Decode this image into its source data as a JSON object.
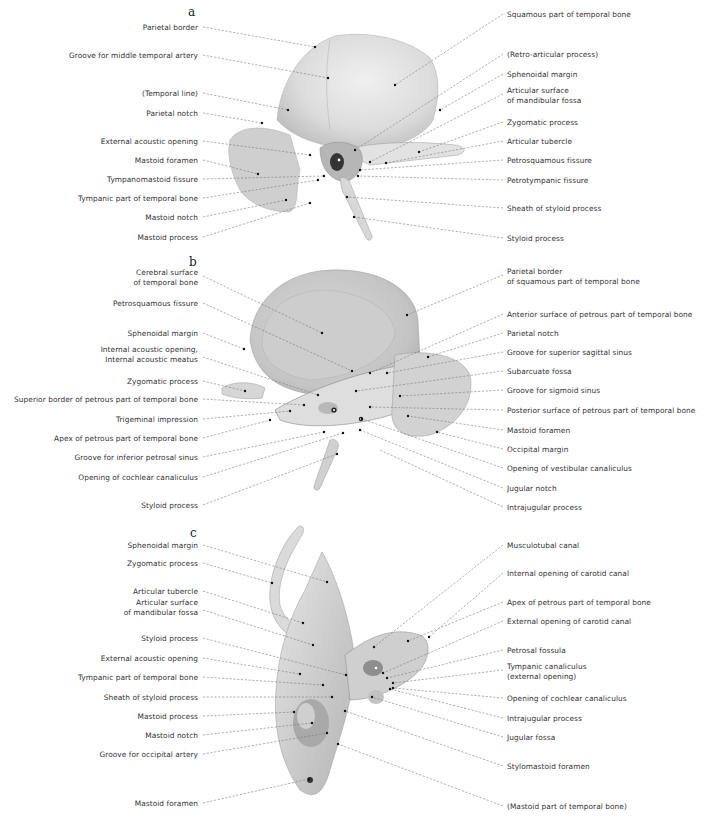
{
  "figure": {
    "subject": "Temporal bone",
    "panels": [
      {
        "id": "a",
        "letter": "a",
        "left_labels": [
          "Parietal border",
          "Groove for middle temporal artery",
          "(Temporal line)",
          "Parietal notch",
          "External acoustic opening",
          "Mastoid foramen",
          "Tympanomastoid fissure",
          "Tympanic part of temporal bone",
          "Mastoid notch",
          "Mastoid process"
        ],
        "right_labels": [
          "Squamous part of temporal bone",
          "(Retro-articular process)",
          "Sphenoidal margin",
          "Articular surface\nof mandibular fossa",
          "Zygomatic process",
          "Articular tubercle",
          "Petrosquamous fissure",
          "Petrotympanic fissure",
          "Sheath of styloid process",
          "Styloid process"
        ]
      },
      {
        "id": "b",
        "letter": "b",
        "left_labels": [
          "Cerebral surface\nof temporal bone",
          "Petrosquamous fissure",
          "Sphenoidal margin",
          "Internal acoustic opening,\nInternal acoustic meatus",
          "Zygomatic process",
          "Superior border of petrous part of temporal bone",
          "Trigeminal impression",
          "Apex of petrous part of temporal bone",
          "Groove for inferior petrosal sinus",
          "Opening of cochlear canaliculus",
          "Styloid process"
        ],
        "right_labels": [
          "Parietal border\nof squamous part of temporal bone",
          "Anterior surface of petrous part of temporal bone",
          "Parietal notch",
          "Groove for superior sagittal sinus",
          "Subarcuate fossa",
          "Groove for sigmoid sinus",
          "Posterior surface of petrous part of temporal bone",
          "Mastoid foramen",
          "Occipital margin",
          "Opening of vestibular canaliculus",
          "Jugular notch",
          "Intrajugular process"
        ]
      },
      {
        "id": "c",
        "letter": "c",
        "left_labels": [
          "Sphenoidal margin",
          "Zygomatic process",
          "Articular tubercle",
          "Articular surface\nof mandibular fossa",
          "Styloid process",
          "External acoustic opening",
          "Tympanic part of temporal bone",
          "Sheath of styloid process",
          "Mastoid process",
          "Mastoid notch",
          "Groove for occipital artery",
          "Mastoid foramen"
        ],
        "right_labels": [
          "Musculotubal canal",
          "Internal opening of carotid canal",
          "Apex of petrous part of temporal bone",
          "External opening of carotid canal",
          "Petrosal fossula",
          "Tympanic canaliculus\n(external opening)",
          "Opening of cochlear canaliculus",
          "Intrajugular process",
          "Jugular fossa",
          "Stylomastoid foramen",
          "(Mastoid part of temporal bone)"
        ]
      }
    ]
  },
  "colors": {
    "background": "#ffffff",
    "text": "#333333",
    "leader": "#7a7a7a",
    "bone_light": "#e4e4e4",
    "bone_mid": "#c9c9c9",
    "bone_dark": "#9a9a9a"
  }
}
